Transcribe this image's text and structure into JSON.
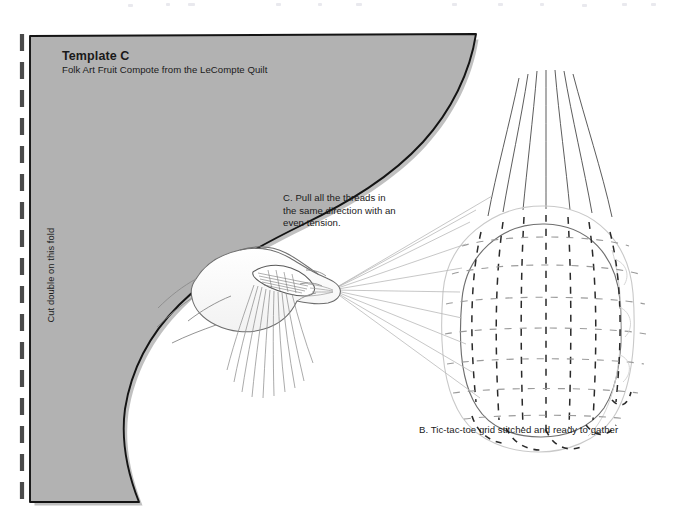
{
  "document": {
    "type": "sewing-pattern-template-sheet",
    "page_background": "#ffffff",
    "template_fill": "#b2b2b2",
    "outline_color": "#1a1a1a",
    "ink_color": "#1a1a1a"
  },
  "template": {
    "title": "Template C",
    "subtitle": "Folk Art Fruit Compote from the LeCompte Quilt",
    "fold_instruction": "Cut double on this fold"
  },
  "figures": [
    {
      "id": "figure-c",
      "caption": "C. Pull all the threads in\nthe same direction with an\neven tension.",
      "caption_lines": [
        "C. Pull all the threads in",
        "the same direction with an",
        "even tension."
      ],
      "illustration": "hand-pulling-threads"
    },
    {
      "id": "figure-b",
      "caption": "B. Tic-tac-toe grid stitched and ready to gather",
      "illustration": "gathered-fabric-ball-with-grid"
    }
  ],
  "icons": {
    "fold_line": "dashed-fold-line-icon"
  }
}
